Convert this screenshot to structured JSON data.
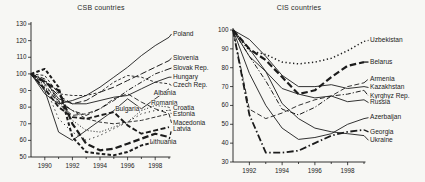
{
  "theme": {
    "ink": "#1c1c1c",
    "background": "#f7f7f4",
    "label_color": "#222222"
  },
  "chart_data": [
    {
      "type": "line",
      "title": "CSB countries",
      "x_range": [
        1989,
        1999
      ],
      "x_ticks_labeled": [
        1990,
        1992,
        1994,
        1996,
        1998
      ],
      "y_range": [
        50,
        130
      ],
      "y_ticks": [
        50,
        60,
        70,
        80,
        90,
        100,
        110,
        120,
        130
      ],
      "grid": false,
      "legend": "direct-labels-right",
      "years": [
        1989,
        1990,
        1991,
        1992,
        1993,
        1994,
        1995,
        1996,
        1997,
        1998,
        1999
      ],
      "series": [
        {
          "name": "Poland",
          "style": "solid",
          "label_y": 124,
          "values": [
            100,
            88,
            82,
            84,
            87,
            92,
            98,
            104,
            111,
            117,
            122
          ]
        },
        {
          "name": "Slovenia",
          "style": "dash-long",
          "label_y": 109.5,
          "values": [
            100,
            95,
            87,
            82,
            84,
            89,
            92,
            96,
            100,
            104,
            108
          ]
        },
        {
          "name": "Slovak Rep.",
          "style": "dashdot",
          "label_y": 103.5,
          "values": [
            100,
            97,
            83,
            78,
            75,
            79,
            84,
            90,
            95,
            100,
            103
          ]
        },
        {
          "name": "Hungary",
          "style": "solid",
          "label_y": 98,
          "values": [
            100,
            96,
            85,
            82,
            82,
            84,
            86,
            87,
            91,
            95,
            98
          ]
        },
        {
          "name": "Czech Rep.",
          "style": "dash-short",
          "label_y": 93,
          "values": [
            100,
            99,
            88,
            87,
            87,
            89,
            95,
            99,
            98,
            95,
            94
          ]
        },
        {
          "name": "Albania",
          "style": "solid",
          "label_y": 88.5,
          "label_x_year": 1997.9,
          "values": [
            100,
            90,
            65,
            60,
            66,
            72,
            78,
            85,
            79,
            85,
            91
          ]
        },
        {
          "name": "Romania",
          "style": "dash",
          "label_y": 82.5,
          "label_x_year": 1997.7,
          "values": [
            100,
            94,
            82,
            75,
            76,
            79,
            85,
            88,
            83,
            79,
            76
          ]
        },
        {
          "name": "Bulgaria",
          "style": "thick-dash-med",
          "label_y": 79,
          "label_x_year": 1995.1,
          "values": [
            100,
            91,
            80,
            74,
            73,
            75,
            77,
            69,
            64,
            66,
            68
          ]
        },
        {
          "name": "Croatia",
          "style": "dot-sparse",
          "label_y": 79.5,
          "values": [
            100,
            93,
            73,
            65,
            60,
            63,
            67,
            71,
            76,
            78,
            78
          ]
        },
        {
          "name": "Estonia",
          "style": "dot",
          "label_y": 75.5,
          "values": [
            100,
            92,
            84,
            72,
            66,
            65,
            68,
            71,
            78,
            81,
            80
          ]
        },
        {
          "name": "Macedonia",
          "style": "dash-med",
          "label_y": 70.5,
          "values": [
            100,
            90,
            84,
            78,
            73,
            71,
            70,
            71,
            72,
            74,
            76
          ]
        },
        {
          "name": "Latvia",
          "style": "thick-dash-short",
          "label_y": 66.5,
          "values": [
            100,
            103,
            92,
            62,
            53,
            52,
            51,
            53,
            57,
            59,
            60
          ]
        },
        {
          "name": "Lithuania",
          "style": "thick-dash",
          "label_y": 59,
          "label_x_year": 1997.6,
          "values": [
            100,
            95,
            90,
            70,
            58,
            54,
            55,
            58,
            61,
            64,
            62
          ]
        }
      ]
    },
    {
      "type": "line",
      "title": "CIS countries",
      "x_range": [
        1991,
        1999
      ],
      "x_ticks_labeled": [
        1992,
        1994,
        1996,
        1998
      ],
      "y_range": [
        30,
        100
      ],
      "y_ticks": [
        30,
        40,
        50,
        60,
        70,
        80,
        90,
        100
      ],
      "grid": false,
      "legend": "direct-labels-right",
      "years": [
        1991,
        1992,
        1993,
        1994,
        1995,
        1996,
        1997,
        1998,
        1999
      ],
      "series": [
        {
          "name": "Uzbekistan",
          "style": "dot-bold",
          "label_y": 94.5,
          "values": [
            100,
            89,
            87,
            83,
            82,
            83,
            85,
            89,
            94
          ]
        },
        {
          "name": "Belarus",
          "style": "thick-dash",
          "label_y": 83,
          "values": [
            100,
            90,
            84,
            75,
            66,
            68,
            75,
            81,
            83
          ]
        },
        {
          "name": "Armenia",
          "style": "dash",
          "label_y": 74,
          "values": [
            100,
            58,
            53,
            56,
            60,
            63,
            65,
            70,
            72
          ]
        },
        {
          "name": "Kazakhstan",
          "style": "solid",
          "label_y": 69.5,
          "values": [
            100,
            95,
            86,
            76,
            70,
            70,
            71,
            69,
            70
          ]
        },
        {
          "name": "Kyrghyz Rep.",
          "style": "dashdot",
          "label_y": 65,
          "values": [
            100,
            86,
            73,
            58,
            55,
            59,
            65,
            66,
            68
          ]
        },
        {
          "name": "Russia",
          "style": "solid",
          "label_y": 61.5,
          "values": [
            100,
            86,
            78,
            69,
            66,
            64,
            65,
            62,
            63
          ]
        },
        {
          "name": "Azerbaijan",
          "style": "solid",
          "label_y": 53.5,
          "values": [
            100,
            77,
            60,
            48,
            42,
            43,
            45,
            50,
            53
          ]
        },
        {
          "name": "Georgia",
          "style": "thick-dashdot",
          "label_y": 46,
          "values": [
            100,
            55,
            35,
            35,
            36,
            40,
            44,
            46,
            47
          ]
        },
        {
          "name": "Ukraine",
          "style": "solid",
          "label_y": 41.5,
          "values": [
            100,
            90,
            78,
            61,
            53,
            48,
            46,
            45,
            44
          ]
        }
      ]
    }
  ]
}
